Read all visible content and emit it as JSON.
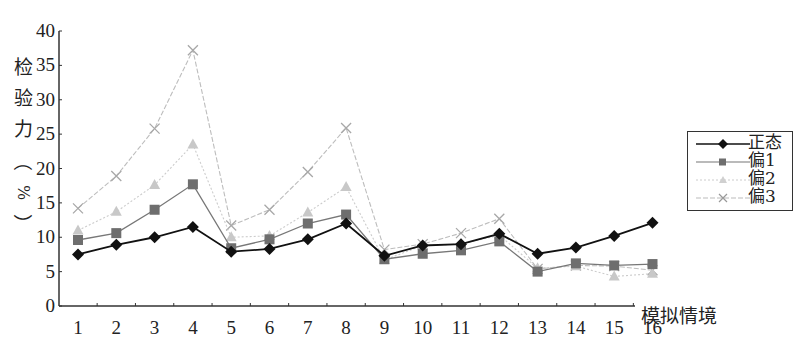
{
  "chart_data": {
    "type": "line",
    "title": "",
    "xlabel": "模拟情境",
    "ylabel": "检验力（%）",
    "ylim": [
      0,
      40
    ],
    "yticks": [
      0,
      5,
      10,
      15,
      20,
      25,
      30,
      35,
      40
    ],
    "categories": [
      "1",
      "2",
      "3",
      "4",
      "5",
      "6",
      "7",
      "8",
      "9",
      "10",
      "11",
      "12",
      "13",
      "14",
      "15",
      "16"
    ],
    "grid": false,
    "legend_position": "right",
    "series": [
      {
        "name": "正态",
        "marker": "diamond",
        "color": "#111111",
        "values": [
          7.5,
          8.9,
          10.0,
          11.5,
          7.9,
          8.3,
          9.7,
          12.0,
          7.3,
          8.8,
          9.0,
          10.5,
          7.6,
          8.5,
          10.2,
          12.1
        ]
      },
      {
        "name": "偏1",
        "marker": "square",
        "color": "#6e6e6e",
        "values": [
          9.6,
          10.6,
          14.0,
          17.7,
          8.4,
          9.7,
          12.0,
          13.3,
          6.8,
          7.6,
          8.1,
          9.4,
          5.0,
          6.2,
          5.9,
          6.1
        ]
      },
      {
        "name": "偏2",
        "marker": "triangle",
        "color": "#c8c8c8",
        "values": [
          11.0,
          13.7,
          17.6,
          23.5,
          10.0,
          10.2,
          13.6,
          17.3,
          6.7,
          8.8,
          9.0,
          10.3,
          5.5,
          5.8,
          4.3,
          4.7
        ]
      },
      {
        "name": "偏3",
        "marker": "cross",
        "color": "#b4b4b4",
        "values": [
          14.2,
          18.9,
          25.8,
          37.2,
          11.7,
          14.0,
          19.5,
          25.9,
          8.2,
          9.0,
          10.6,
          12.7,
          5.4,
          5.9,
          5.8,
          5.2
        ]
      }
    ]
  },
  "axis": {
    "ylabel_chars": [
      "检",
      "验",
      "力",
      "（",
      "%",
      "）"
    ],
    "xlabel": "模拟情境"
  },
  "legend": {
    "items": [
      "正态",
      "偏1",
      "偏2",
      "偏3"
    ]
  }
}
